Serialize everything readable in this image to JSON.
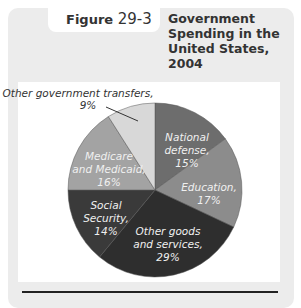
{
  "figure": {
    "label_prefix": "Figure",
    "label_number": "29-3",
    "title_lines": [
      "Government",
      "Spending in the",
      "United States,",
      "2004"
    ]
  },
  "chart_data": {
    "type": "pie",
    "title": "Government Spending in the United States, 2004",
    "start_angle": "12 o'clock, clockwise",
    "categories": [
      "National defense",
      "Education",
      "Other goods and services",
      "Social Security",
      "Medicare and Medicaid",
      "Other government transfers"
    ],
    "values": [
      15,
      17,
      29,
      14,
      16,
      9
    ],
    "unit": "%",
    "colors": [
      "#6d6d6d",
      "#8c8c8c",
      "#2e2e2e",
      "#3a3a3a",
      "#a3a3a3",
      "#d8d8d8"
    ],
    "labels": [
      {
        "lines": [
          "National",
          "defense,",
          "15%"
        ]
      },
      {
        "lines": [
          "Education,",
          "17%"
        ]
      },
      {
        "lines": [
          "Other goods",
          "and services,",
          "29%"
        ]
      },
      {
        "lines": [
          "Social",
          "Security,",
          "14%"
        ]
      },
      {
        "lines": [
          "Medicare",
          "and Medicaid,",
          "16%"
        ]
      },
      {
        "lines": [
          "Other government transfers,",
          "9%"
        ]
      }
    ]
  }
}
